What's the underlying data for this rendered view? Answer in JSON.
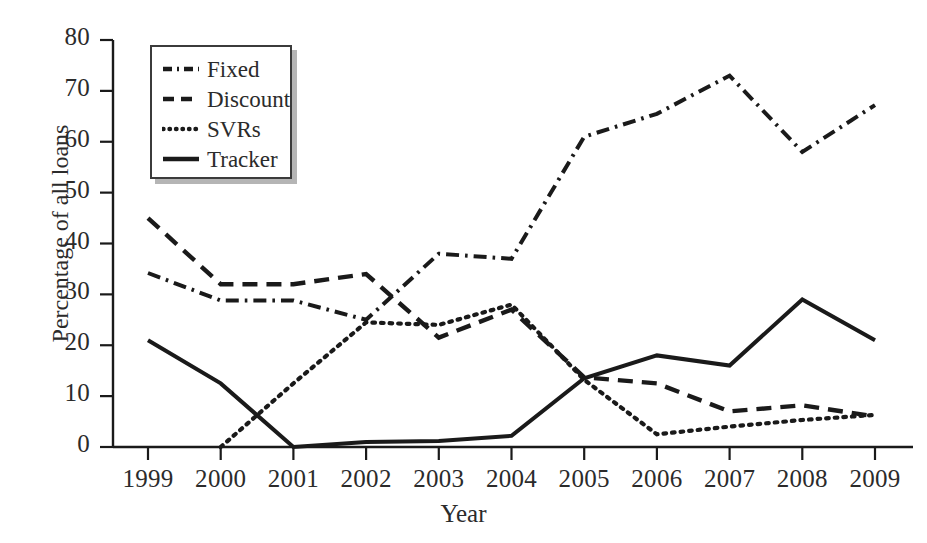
{
  "chart_data": {
    "type": "line",
    "title": "",
    "xlabel": "Year",
    "ylabel": "Percentage of all loans",
    "categories": [
      "1999",
      "2000",
      "2001",
      "2002",
      "2003",
      "2004",
      "2005",
      "2006",
      "2007",
      "2008",
      "2009"
    ],
    "x": [
      1999,
      2000,
      2001,
      2002,
      2003,
      2004,
      2005,
      2006,
      2007,
      2008,
      2009
    ],
    "xlim": [
      1999,
      2009
    ],
    "ylim": [
      0,
      80
    ],
    "yticks": [
      0,
      10,
      20,
      30,
      40,
      50,
      60,
      70,
      80
    ],
    "grid": false,
    "legend_position": "upper-left-inside",
    "series": [
      {
        "name": "Fixed",
        "style": "dash-dot",
        "color": "#1a1a1a",
        "values": [
          34.2,
          28.8,
          28.8,
          25.0,
          38.0,
          37.0,
          61.0,
          65.5,
          73.0,
          58.0,
          67.2
        ]
      },
      {
        "name": "Discount",
        "style": "dashed",
        "color": "#1a1a1a",
        "values": [
          45.0,
          32.0,
          32.0,
          34.0,
          21.5,
          27.0,
          13.7,
          12.5,
          7.0,
          8.2,
          6.0
        ]
      },
      {
        "name": "SVRs",
        "style": "dotted",
        "color": "#1a1a1a",
        "values": [
          null,
          0.0,
          12.5,
          24.5,
          24.0,
          28.0,
          13.2,
          2.5,
          4.0,
          5.3,
          6.3
        ]
      },
      {
        "name": "Tracker",
        "style": "solid",
        "color": "#1a1a1a",
        "values": [
          21.0,
          12.5,
          0.0,
          1.0,
          1.2,
          2.2,
          13.5,
          18.0,
          16.0,
          29.0,
          21.0
        ]
      }
    ]
  },
  "axes": {
    "ylabel": "Percentage of all loans",
    "xlabel": "Year",
    "ytick_labels": [
      "80",
      "70",
      "60",
      "50",
      "40",
      "30",
      "20",
      "10",
      "0"
    ],
    "xtick_labels": [
      "1999",
      "2000",
      "2001",
      "2002",
      "2003",
      "2004",
      "2005",
      "2006",
      "2007",
      "2008",
      "2009"
    ]
  },
  "legend": {
    "items": [
      {
        "label": "Fixed",
        "style": "dash-dot"
      },
      {
        "label": "Discount",
        "style": "dashed"
      },
      {
        "label": "SVRs",
        "style": "dotted"
      },
      {
        "label": "Tracker",
        "style": "solid"
      }
    ]
  }
}
